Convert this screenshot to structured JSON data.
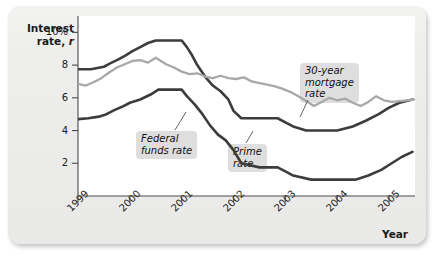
{
  "chart_data": {
    "type": "line",
    "title": "",
    "xlabel": "Year",
    "ylabel": "Interest rate, r",
    "ylabel_main": "Interest",
    "ylabel_sub_prefix": "rate, ",
    "ylabel_sub_italic": "r",
    "xlim": [
      1999,
      2005.5
    ],
    "ylim": [
      0,
      11
    ],
    "grid": false,
    "legend_position": "inline-callouts",
    "y_ticks": [
      {
        "value": 10,
        "label": "10%"
      },
      {
        "value": 8,
        "label": "8"
      },
      {
        "value": 6,
        "label": "6"
      },
      {
        "value": 4,
        "label": "4"
      },
      {
        "value": 2,
        "label": "2"
      }
    ],
    "x_ticks": [
      {
        "value": 1999,
        "label": "1999"
      },
      {
        "value": 2000,
        "label": "2000"
      },
      {
        "value": 2001,
        "label": "2001"
      },
      {
        "value": 2002,
        "label": "2002"
      },
      {
        "value": 2003,
        "label": "2003"
      },
      {
        "value": 2004,
        "label": "2004"
      },
      {
        "value": 2005,
        "label": "2005"
      }
    ],
    "annotations": [
      {
        "name": "mortgage",
        "text": "30-year\nmortgage\nrate"
      },
      {
        "name": "federal",
        "text": "Federal\nfunds rate"
      },
      {
        "name": "prime",
        "text": "Prime\nrate"
      }
    ],
    "series": [
      {
        "name": "Prime rate",
        "color": "#3c3c3c",
        "width": 2.6,
        "x": [
          1999.0,
          1999.25,
          1999.5,
          1999.62,
          1999.78,
          1999.92,
          2000.05,
          2000.2,
          2000.35,
          2000.5,
          2000.75,
          2001.0,
          2001.1,
          2001.2,
          2001.3,
          2001.45,
          2001.6,
          2001.75,
          2001.9,
          2002.0,
          2002.15,
          2002.5,
          2002.85,
          2003.0,
          2003.15,
          2003.4,
          2003.6,
          2004.0,
          2004.3,
          2004.55,
          2004.8,
          2005.0,
          2005.2,
          2005.45
        ],
        "y": [
          7.75,
          7.75,
          7.9,
          8.1,
          8.35,
          8.6,
          8.85,
          9.1,
          9.35,
          9.5,
          9.5,
          9.5,
          9.1,
          8.6,
          8.0,
          7.3,
          6.75,
          6.4,
          5.9,
          5.2,
          4.75,
          4.75,
          4.75,
          4.5,
          4.25,
          4.0,
          4.0,
          4.0,
          4.25,
          4.6,
          5.0,
          5.4,
          5.7,
          5.9
        ]
      },
      {
        "name": "30-year mortgage rate",
        "color": "#a8a8a8",
        "width": 2.3,
        "x": [
          1999.0,
          1999.15,
          1999.3,
          1999.45,
          1999.6,
          1999.75,
          1999.9,
          2000.05,
          2000.2,
          2000.35,
          2000.5,
          2000.6,
          2000.7,
          2000.85,
          2001.0,
          2001.15,
          2001.3,
          2001.45,
          2001.6,
          2001.75,
          2001.9,
          2002.05,
          2002.2,
          2002.35,
          2002.5,
          2002.65,
          2002.8,
          2002.95,
          2003.1,
          2003.25,
          2003.4,
          2003.55,
          2003.7,
          2003.85,
          2004.0,
          2004.15,
          2004.3,
          2004.45,
          2004.6,
          2004.75,
          2004.9,
          2005.05,
          2005.2,
          2005.35,
          2005.5
        ],
        "y": [
          6.85,
          6.75,
          6.95,
          7.2,
          7.55,
          7.85,
          8.05,
          8.25,
          8.3,
          8.15,
          8.45,
          8.25,
          8.05,
          7.85,
          7.6,
          7.45,
          7.5,
          7.3,
          7.2,
          7.35,
          7.2,
          7.15,
          7.25,
          7.0,
          6.9,
          6.8,
          6.7,
          6.55,
          6.35,
          6.1,
          5.8,
          5.5,
          5.75,
          6.0,
          5.85,
          5.95,
          5.7,
          5.5,
          5.75,
          6.1,
          5.85,
          5.75,
          5.8,
          5.85,
          5.9
        ]
      },
      {
        "name": "Federal funds rate",
        "color": "#3c3c3c",
        "width": 2.6,
        "x": [
          1999.0,
          1999.2,
          1999.4,
          1999.55,
          1999.7,
          1999.85,
          2000.0,
          2000.2,
          2000.4,
          2000.55,
          2000.75,
          2001.0,
          2001.1,
          2001.25,
          2001.4,
          2001.55,
          2001.7,
          2001.85,
          2002.0,
          2002.15,
          2002.5,
          2002.85,
          2003.0,
          2003.15,
          2003.5,
          2003.8,
          2004.0,
          2004.35,
          2004.6,
          2004.85,
          2005.05,
          2005.25,
          2005.45
        ],
        "y": [
          4.7,
          4.75,
          4.85,
          5.0,
          5.25,
          5.45,
          5.7,
          5.9,
          6.2,
          6.5,
          6.5,
          6.5,
          6.1,
          5.6,
          5.0,
          4.3,
          3.75,
          3.4,
          2.8,
          2.0,
          1.75,
          1.75,
          1.5,
          1.25,
          1.0,
          1.0,
          1.0,
          1.0,
          1.25,
          1.6,
          2.0,
          2.4,
          2.7
        ]
      }
    ]
  },
  "axis": {
    "y_title_line1": "Interest",
    "y_title_line2_prefix": "rate, ",
    "y_title_line2_italic": "r",
    "x_title": "Year"
  }
}
